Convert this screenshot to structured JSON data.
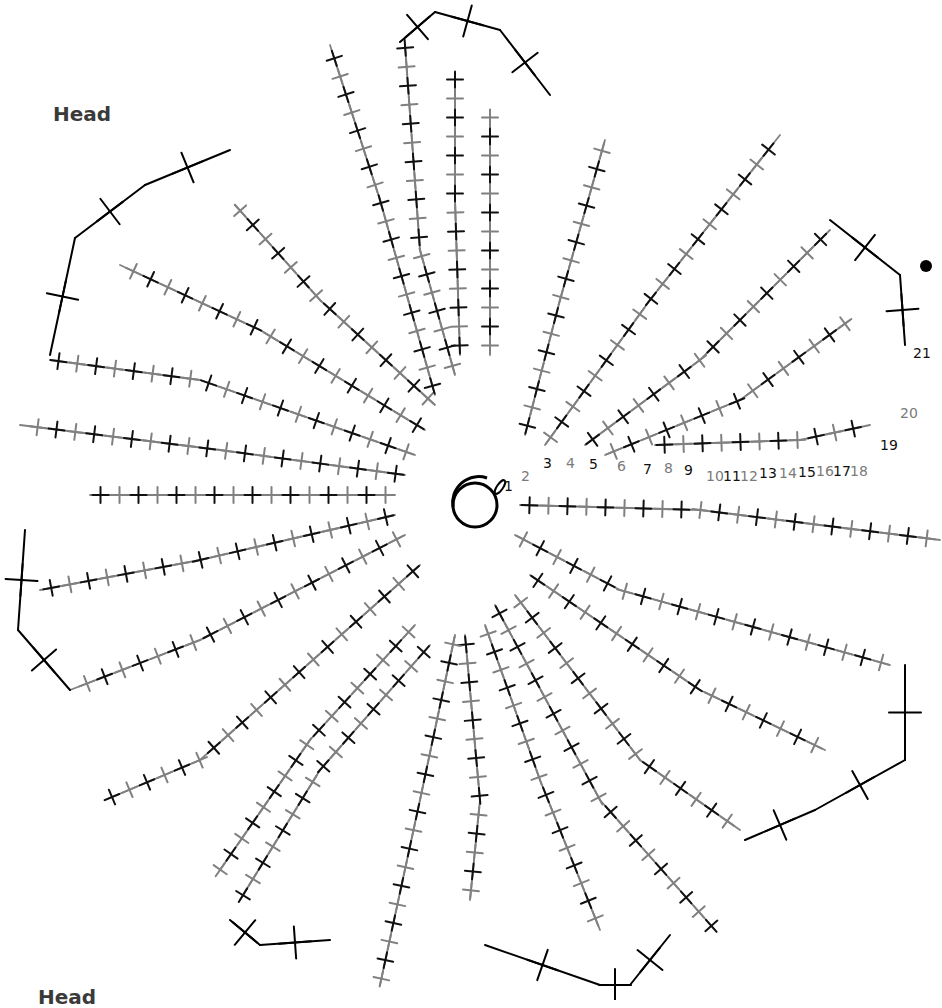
{
  "labels": {
    "head_top": "Head",
    "head_bottom": "Head"
  },
  "colors": {
    "black_rows": "#111111",
    "grey_rows": "#808080",
    "background": "#ffffff"
  },
  "legend_symbols": {
    "single_crochet": "X / + cross stitch",
    "magic_ring": "circle",
    "start_marker": "filled dot"
  },
  "center": {
    "x": 475,
    "y": 505,
    "ring_radius": 22
  },
  "row_numbers": [
    {
      "n": "1",
      "x": 504,
      "y": 478,
      "color": "black"
    },
    {
      "n": "2",
      "x": 521,
      "y": 468,
      "color": "grey"
    },
    {
      "n": "3",
      "x": 543,
      "y": 455,
      "color": "black"
    },
    {
      "n": "4",
      "x": 566,
      "y": 455,
      "color": "grey"
    },
    {
      "n": "5",
      "x": 589,
      "y": 456,
      "color": "black"
    },
    {
      "n": "6",
      "x": 617,
      "y": 458,
      "color": "grey"
    },
    {
      "n": "7",
      "x": 643,
      "y": 461,
      "color": "black"
    },
    {
      "n": "8",
      "x": 664,
      "y": 460,
      "color": "grey"
    },
    {
      "n": "9",
      "x": 684,
      "y": 462,
      "color": "black"
    },
    {
      "n": "10",
      "x": 706,
      "y": 468,
      "color": "grey"
    },
    {
      "n": "11",
      "x": 723,
      "y": 468,
      "color": "black"
    },
    {
      "n": "12",
      "x": 740,
      "y": 468,
      "color": "grey"
    },
    {
      "n": "13",
      "x": 759,
      "y": 465,
      "color": "black"
    },
    {
      "n": "14",
      "x": 779,
      "y": 465,
      "color": "grey"
    },
    {
      "n": "15",
      "x": 798,
      "y": 464,
      "color": "black"
    },
    {
      "n": "16",
      "x": 816,
      "y": 463,
      "color": "grey"
    },
    {
      "n": "17",
      "x": 833,
      "y": 463,
      "color": "black"
    },
    {
      "n": "18",
      "x": 850,
      "y": 463,
      "color": "grey"
    },
    {
      "n": "19",
      "x": 880,
      "y": 437,
      "color": "black"
    },
    {
      "n": "20",
      "x": 900,
      "y": 405,
      "color": "grey"
    },
    {
      "n": "21",
      "x": 913,
      "y": 345,
      "color": "black"
    }
  ],
  "petals_count": 8,
  "marker_dot": {
    "x": 926,
    "y": 266
  }
}
